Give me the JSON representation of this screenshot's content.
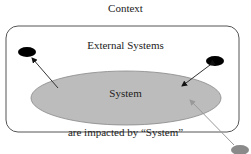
{
  "title": "Context",
  "container_label": "External Systems",
  "system_label": "System",
  "footer_label": "are impacted by “System”",
  "colors": {
    "system_fill": "#bcbcbc",
    "external_node": "#000000",
    "incoming_node": "#8a8a8a",
    "incoming_line": "#999999",
    "border": "#555555"
  }
}
